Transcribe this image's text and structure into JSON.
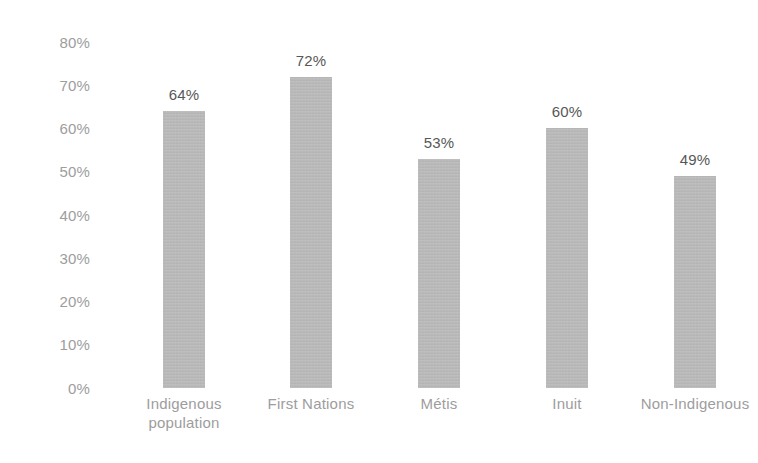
{
  "chart_data": {
    "type": "bar",
    "title": "",
    "subtitle": "",
    "xlabel": "",
    "ylabel": "",
    "ylim": [
      0,
      80
    ],
    "grid": false,
    "legend": false,
    "orientation": "vertical",
    "value_label_format": "percent",
    "categories": [
      "Indigenous population",
      "First Nations",
      "Métis",
      "Inuit",
      "Non-Indigenous"
    ],
    "values": [
      64,
      72,
      53,
      60,
      49
    ],
    "value_labels": [
      "64%",
      "72%",
      "53%",
      "60%",
      "49%"
    ],
    "y_ticks": [
      0,
      10,
      20,
      30,
      40,
      50,
      60,
      70,
      80
    ],
    "y_tick_labels": [
      "0%",
      "10%",
      "20%",
      "30%",
      "40%",
      "50%",
      "60%",
      "70%",
      "80%"
    ],
    "bars": [
      {
        "category": "Indigenous population",
        "category_lines": [
          "Indigenous",
          "population"
        ],
        "value": 64,
        "value_label": "64%"
      },
      {
        "category": "First Nations",
        "category_lines": [
          "First Nations"
        ],
        "value": 72,
        "value_label": "72%"
      },
      {
        "category": "Métis",
        "category_lines": [
          "Métis"
        ],
        "value": 53,
        "value_label": "53%"
      },
      {
        "category": "Inuit",
        "category_lines": [
          "Inuit"
        ],
        "value": 60,
        "value_label": "60%"
      },
      {
        "category": "Non-Indigenous",
        "category_lines": [
          "Non-Indigenous"
        ],
        "value": 49,
        "value_label": "49%"
      }
    ],
    "colors": {
      "bar_fill": "#b6b6b6",
      "value_label": "#575757",
      "axis_label": "#9d9d9d",
      "background": "#ffffff"
    }
  }
}
